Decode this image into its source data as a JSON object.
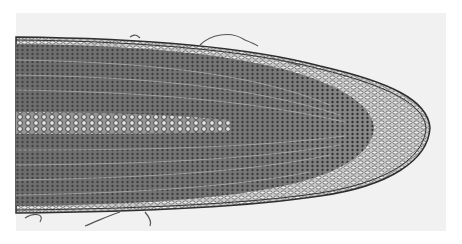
{
  "image": {
    "subject": "root-tip-longitudinal-section",
    "colors": {
      "background": "#ffffff",
      "paper": "#f1f1f1",
      "tissue_dark": "#4a4a4a",
      "tissue_mid": "#7a7a7a",
      "tissue_light": "#b5b5b5",
      "cell_wall": "#2e2e2e",
      "cap_fill": "#e8e8e8"
    }
  }
}
